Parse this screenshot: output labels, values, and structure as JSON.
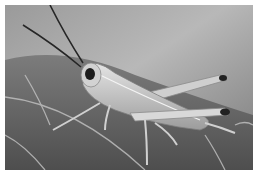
{
  "image": {
    "subject": "grasshopper on a leaf",
    "style": "monochrome macro photograph",
    "colors": {
      "background_light": "#bdbdbd",
      "background_dark": "#5a5a5a",
      "leaf": "#6e6e6e",
      "vein": "#c8c8c8",
      "body": "#d6d6d6",
      "eye": "#1e1e1e",
      "antenna": "#2a2a2a"
    }
  }
}
